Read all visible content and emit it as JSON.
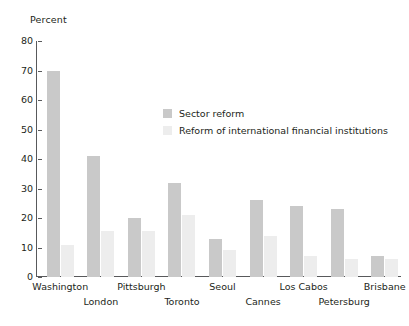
{
  "chart_data": {
    "type": "bar",
    "title": "",
    "subtitle": "",
    "xlabel": "",
    "ylabel": "Percent",
    "ylim": [
      0,
      80
    ],
    "ytick_step": 10,
    "yticks": [
      80,
      70,
      60,
      50,
      40,
      30,
      20,
      10,
      0
    ],
    "grid": false,
    "legend_position": "inside-upper-center",
    "categories": [
      "Washington",
      "London",
      "Pittsburgh",
      "Toronto",
      "Seoul",
      "Cannes",
      "Los Cabos",
      "Petersburg",
      "Brisbane"
    ],
    "category_rows": [
      0,
      1,
      0,
      1,
      0,
      1,
      0,
      1,
      0
    ],
    "series": [
      {
        "name": "Sector reform",
        "color": "#c9c9c9",
        "values": [
          70,
          41,
          20,
          32,
          13,
          26,
          24,
          23,
          7
        ]
      },
      {
        "name": "Reform of international financial institutions",
        "color": "#ededed",
        "values": [
          11,
          15.5,
          15.5,
          21,
          9,
          14,
          7,
          6,
          6
        ]
      }
    ]
  },
  "legend": {
    "items": [
      {
        "label": "Sector reform",
        "swatch": "sector"
      },
      {
        "label": "Reform of international financial institutions",
        "swatch": "ifi"
      }
    ]
  }
}
